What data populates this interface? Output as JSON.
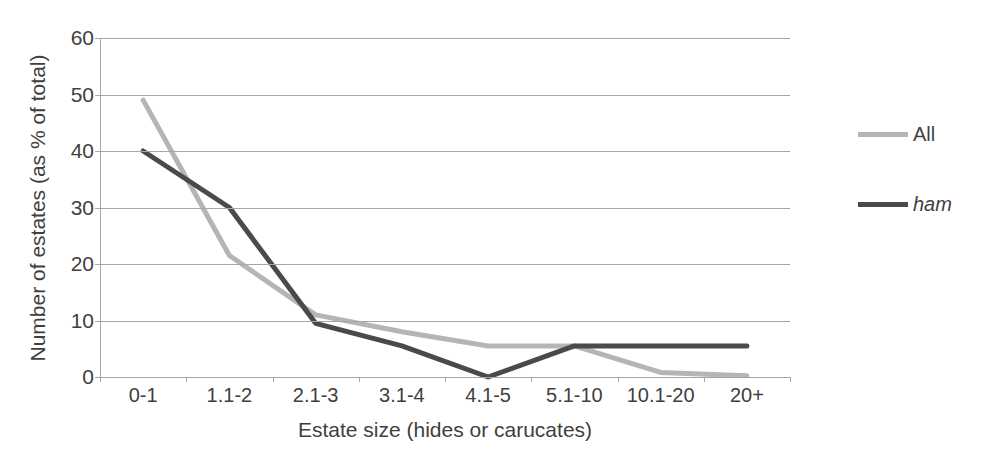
{
  "chart_data": {
    "type": "line",
    "title": "",
    "xlabel": "Estate size (hides or carucates)",
    "ylabel": "Number of estates (as % of total)",
    "categories": [
      "0-1",
      "1.1-2",
      "2.1-3",
      "3.1-4",
      "4.1-5",
      "5.1-10",
      "10.1-20",
      "20+"
    ],
    "series": [
      {
        "name": "All",
        "color": "#b5b5b5",
        "italic": false,
        "values": [
          49,
          21.5,
          11,
          8,
          5.5,
          5.5,
          0.8,
          0.2
        ]
      },
      {
        "name": "ham",
        "color": "#4a4a4a",
        "italic": true,
        "values": [
          40,
          30,
          9.5,
          5.5,
          0,
          5.5,
          5.5,
          5.5
        ]
      }
    ],
    "ylim": [
      0,
      60
    ],
    "ytick_values": [
      0,
      10,
      20,
      30,
      40,
      50,
      60
    ],
    "ytick_labels": [
      "0",
      "10",
      "20",
      "30",
      "40",
      "50",
      "60"
    ],
    "grid": true,
    "legend_position": "right",
    "gridline_color": "#a6a6a6",
    "background_color": "#ffffff",
    "text_color": "#3f3f3f"
  }
}
